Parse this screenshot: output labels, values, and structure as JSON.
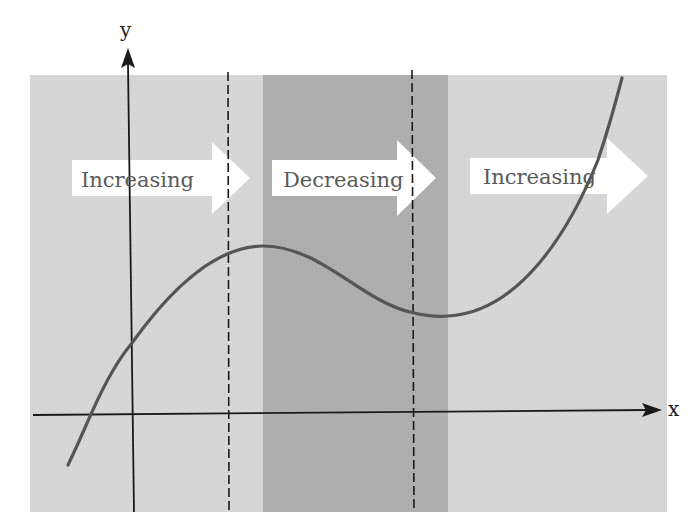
{
  "diagram": {
    "title": "",
    "axes": {
      "x_label": "x",
      "y_label": "y"
    },
    "regions": [
      {
        "id": "increasing-1",
        "label": "Increasing",
        "shade": "light",
        "color": "#d6d6d6"
      },
      {
        "id": "decreasing",
        "label": "Decreasing",
        "shade": "dark",
        "color": "#aeaeae"
      },
      {
        "id": "increasing-2",
        "label": "Increasing",
        "shade": "light",
        "color": "#d6d6d6"
      }
    ],
    "boundaries": [
      {
        "id": "local-max-line",
        "style": "dashed"
      },
      {
        "id": "local-min-line",
        "style": "dashed"
      }
    ],
    "curve": {
      "description": "cubic function: increasing, local maximum, decreasing, local minimum, increasing",
      "color": "#555555",
      "key_points": [
        {
          "name": "start",
          "x": 68,
          "y": 465
        },
        {
          "name": "x-intercept",
          "x": 92,
          "y": 412
        },
        {
          "name": "y-intercept",
          "x": 132,
          "y": 343
        },
        {
          "name": "local-max",
          "x": 263,
          "y": 246
        },
        {
          "name": "local-min",
          "x": 445,
          "y": 316
        },
        {
          "name": "end",
          "x": 622,
          "y": 78
        }
      ]
    },
    "colors": {
      "light_region": "#d6d6d6",
      "dark_region": "#aeaeae",
      "arrow_fill": "#ffffff",
      "axis": "#1a1a1a",
      "curve": "#555555",
      "text": "#5a5a5a"
    }
  }
}
